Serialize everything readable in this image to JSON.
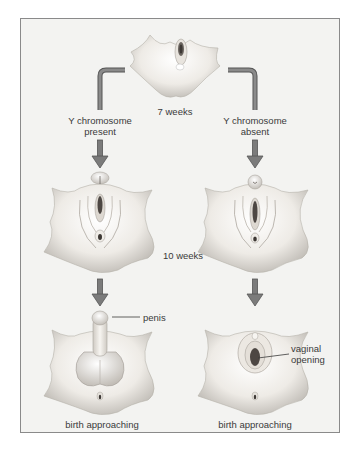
{
  "diagram": {
    "type": "flowchart",
    "stages": {
      "top": {
        "label": "7 weeks"
      },
      "middle": {
        "label": "10 weeks"
      },
      "bottom_left": {
        "label": "birth approaching"
      },
      "bottom_right": {
        "label": "birth approaching"
      }
    },
    "branches": {
      "left": {
        "line1": "Y chromosome",
        "line2": "present"
      },
      "right": {
        "line1": "Y chromosome",
        "line2": "absent"
      }
    },
    "annotations": {
      "penis": "penis",
      "vaginal_line1": "vaginal",
      "vaginal_line2": "opening"
    },
    "colors": {
      "arrow": "#7b7b7b",
      "arrow_edge": "#555555",
      "frame_border": "#8a8a8a",
      "background": "#f3f3f1",
      "skin_light": "#f4f1ec",
      "skin_shade": "#c9c5bf",
      "text": "#3a3a3a"
    }
  }
}
